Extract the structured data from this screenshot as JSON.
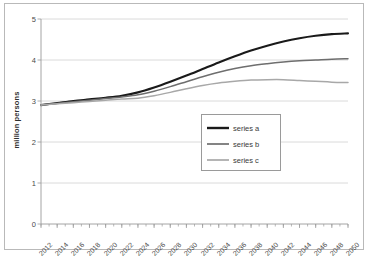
{
  "chart_data": {
    "type": "line",
    "title": "",
    "xlabel": "",
    "ylabel": "million persons",
    "ylim": [
      0,
      5
    ],
    "xlim": [
      2012,
      2050
    ],
    "grid": true,
    "legend_position": "center",
    "yticks": [
      "0",
      "1",
      "2",
      "3",
      "4",
      "5"
    ],
    "ytick_values": [
      0,
      1,
      2,
      3,
      4,
      5
    ],
    "categories": [
      2012,
      2014,
      2016,
      2018,
      2020,
      2022,
      2024,
      2026,
      2028,
      2030,
      2032,
      2034,
      2036,
      2038,
      2040,
      2042,
      2044,
      2046,
      2048,
      2050
    ],
    "xtick_labels": [
      "2012",
      "2014",
      "2016",
      "2018",
      "2020",
      "2022",
      "2024",
      "2026",
      "2028",
      "2030",
      "2032",
      "2034",
      "2036",
      "2038",
      "2040",
      "2042",
      "2044",
      "2046",
      "2048",
      "2050"
    ],
    "minor_tick_step": 1,
    "series": [
      {
        "name": "series a",
        "color": "#1a1a1a",
        "width": 2.1,
        "values": [
          2.9,
          2.95,
          3.0,
          3.04,
          3.08,
          3.13,
          3.21,
          3.33,
          3.47,
          3.62,
          3.78,
          3.94,
          4.09,
          4.23,
          4.35,
          4.45,
          4.53,
          4.59,
          4.63,
          4.65
        ]
      },
      {
        "name": "series b",
        "color": "#6e6e6e",
        "width": 1.5,
        "values": [
          2.9,
          2.94,
          2.98,
          3.02,
          3.06,
          3.1,
          3.15,
          3.24,
          3.35,
          3.47,
          3.59,
          3.7,
          3.79,
          3.86,
          3.91,
          3.95,
          3.98,
          4.0,
          4.02,
          4.03
        ]
      },
      {
        "name": "series c",
        "color": "#a8a8a8",
        "width": 1.5,
        "values": [
          2.9,
          2.93,
          2.96,
          2.99,
          3.02,
          3.05,
          3.07,
          3.13,
          3.21,
          3.3,
          3.38,
          3.44,
          3.48,
          3.51,
          3.52,
          3.52,
          3.5,
          3.48,
          3.46,
          3.45
        ]
      }
    ]
  },
  "legend": {
    "items": [
      {
        "label": "series a"
      },
      {
        "label": "series b"
      },
      {
        "label": "series c"
      }
    ]
  },
  "colors": {
    "series_a": "#1a1a1a",
    "series_b": "#6e6e6e",
    "series_c": "#a8a8a8",
    "grid": "#d0d0d0",
    "axis": "#9a9a9a",
    "frame": "#b9b9b9"
  }
}
